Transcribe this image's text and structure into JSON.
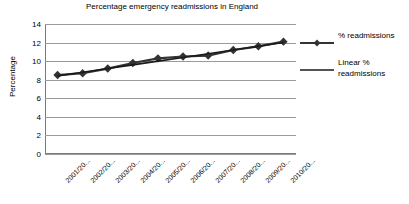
{
  "chart_data": {
    "type": "line",
    "title": "Percentage emergency readmissions in England",
    "xlabel": "",
    "ylabel": "Percentage",
    "ylim": [
      0,
      14
    ],
    "yticks": [
      0,
      2,
      4,
      6,
      8,
      10,
      12,
      14
    ],
    "grid": true,
    "legend_position": "right",
    "categories": [
      "2001/20...",
      "2002/20...",
      "2003/20...",
      "2004/20...",
      "2005/20...",
      "2006/20...",
      "2007/20...",
      "2008/20...",
      "2009/20...",
      "2010/20..."
    ],
    "series": [
      {
        "name": "% readmissions",
        "type": "line-marker",
        "marker": "diamond",
        "color": "#333333",
        "values": [
          8.5,
          8.7,
          9.2,
          9.8,
          10.3,
          10.5,
          10.6,
          11.2,
          11.6,
          12.1
        ]
      },
      {
        "name": "Linear % readmissions",
        "type": "trendline",
        "marker": "none",
        "color": "#1a1a1a",
        "values": [
          8.4,
          8.8,
          9.2,
          9.6,
          10.0,
          10.4,
          10.8,
          11.2,
          11.6,
          12.0
        ]
      }
    ]
  },
  "legend": {
    "entries": [
      {
        "label": "% readmissions",
        "swatch": "line-with-diamond-marker"
      },
      {
        "label": "Linear % readmissions",
        "swatch": "plain-line"
      }
    ]
  },
  "colors": {
    "series": "#333333",
    "trendline": "#1a1a1a",
    "gridline": "#9a9a9a",
    "axis": "#7a7a7a",
    "background": "#ffffff",
    "text": "#000000"
  }
}
